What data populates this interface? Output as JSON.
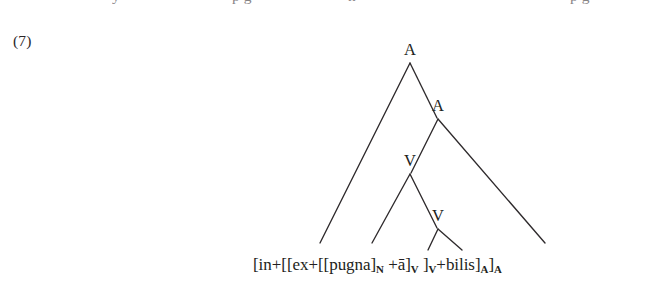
{
  "page": {
    "background_color": "#ffffff",
    "ink_color": "#231f20",
    "top_line_remnant": [
      {
        "text": "y",
        "x": 112
      },
      {
        "text": "p g",
        "x": 232
      },
      {
        "text": "n",
        "x": 348
      },
      {
        "text": "p g",
        "x": 570
      }
    ]
  },
  "example": {
    "number_label": "(7)"
  },
  "tree": {
    "nodes": [
      {
        "id": "root-a",
        "label": "A",
        "x": 410,
        "y": 58,
        "level": 0
      },
      {
        "id": "a-2",
        "label": "A",
        "x": 438,
        "y": 114,
        "level": 1
      },
      {
        "id": "v-1",
        "label": "V",
        "x": 410,
        "y": 169,
        "level": 2
      },
      {
        "id": "v-2",
        "label": "V",
        "x": 438,
        "y": 224,
        "level": 3
      }
    ],
    "edges": [
      {
        "id": "edge-root-left",
        "from": "root-a",
        "x1": 410,
        "y1": 63,
        "x2": 320,
        "y2": 243
      },
      {
        "id": "edge-root-right",
        "from": "root-a",
        "x1": 410,
        "y1": 63,
        "x2": 437,
        "y2": 118
      },
      {
        "id": "edge-a2-left",
        "from": "a-2",
        "x1": 438,
        "y1": 119,
        "x2": 411,
        "y2": 173
      },
      {
        "id": "edge-a2-right",
        "from": "a-2",
        "x1": 438,
        "y1": 119,
        "x2": 545,
        "y2": 243
      },
      {
        "id": "edge-v1-left",
        "from": "v-1",
        "x1": 410,
        "y1": 174,
        "x2": 372,
        "y2": 243
      },
      {
        "id": "edge-v1-right",
        "from": "v-1",
        "x1": 410,
        "y1": 174,
        "x2": 437,
        "y2": 228
      },
      {
        "id": "edge-v2-left",
        "from": "v-2",
        "x1": 438,
        "y1": 229,
        "x2": 428,
        "y2": 250
      },
      {
        "id": "edge-v2-right",
        "from": "v-2",
        "x1": 438,
        "y1": 229,
        "x2": 462,
        "y2": 250
      }
    ]
  },
  "terminal": {
    "full_text": "[in+[[ex+[[pugna]N +ā]V ]V+bilis]A]A",
    "segments": [
      {
        "text": "[in+[[ex+[[pugna]",
        "sub": null
      },
      {
        "text": "",
        "sub": "N"
      },
      {
        "text": " +ā]",
        "sub": null
      },
      {
        "text": "",
        "sub": "V"
      },
      {
        "text": " ]",
        "sub": null
      },
      {
        "text": "",
        "sub": "V"
      },
      {
        "text": "+bilis]",
        "sub": null
      },
      {
        "text": "",
        "sub": "A"
      },
      {
        "text": "]",
        "sub": null
      },
      {
        "text": "",
        "sub": "A"
      }
    ]
  }
}
